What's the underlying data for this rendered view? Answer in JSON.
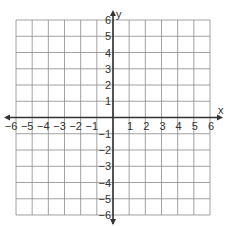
{
  "chart_data": {
    "type": "scatter",
    "title": "",
    "xlabel": "x",
    "ylabel": "y",
    "xlim": [
      -6,
      6
    ],
    "ylim": [
      -6,
      6
    ],
    "grid": true,
    "x_ticks": [
      -6,
      -5,
      -4,
      -3,
      -2,
      -1,
      1,
      2,
      3,
      4,
      5,
      6
    ],
    "y_ticks": [
      6,
      5,
      4,
      3,
      2,
      1,
      -1,
      -2,
      -3,
      -4,
      -5,
      -6
    ],
    "series": []
  },
  "axes": {
    "x_label": "x",
    "y_label": "y"
  },
  "colors": {
    "grid": "#8a8a8a",
    "axis": "#333333",
    "text": "#333333"
  }
}
